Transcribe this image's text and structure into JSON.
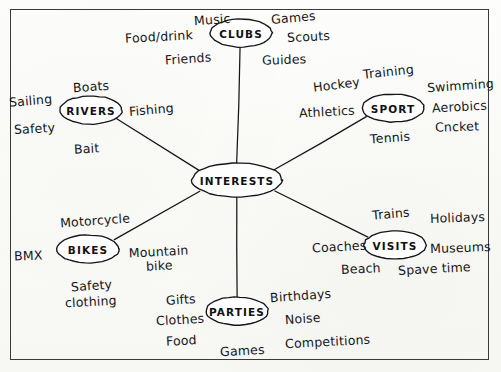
{
  "diagram": {
    "style": {
      "ink": "#15151a",
      "paper": "#fbfbf9",
      "frame": "#3a3a38"
    },
    "center": {
      "label": "INTERESTS",
      "cx": 237,
      "cy": 180,
      "rx": 45,
      "ry": 17
    },
    "branches": [
      {
        "id": "clubs",
        "label": "CLUBS",
        "cx": 241,
        "cy": 33,
        "rx": 31,
        "ry": 14,
        "leaves": [
          {
            "text": "Music",
            "x": 194,
            "y": 13,
            "rot": -4
          },
          {
            "text": "Games",
            "x": 271,
            "y": 11,
            "rot": -5
          },
          {
            "text": "Food/drink",
            "x": 125,
            "y": 30,
            "rot": -3
          },
          {
            "text": "Scouts",
            "x": 287,
            "y": 30,
            "rot": -3
          },
          {
            "text": "Friends",
            "x": 165,
            "y": 52,
            "rot": -4
          },
          {
            "text": "Guides",
            "x": 262,
            "y": 53,
            "rot": -2
          }
        ]
      },
      {
        "id": "sport",
        "label": "SPORT",
        "cx": 393,
        "cy": 108,
        "rx": 31,
        "ry": 14,
        "leaves": [
          {
            "text": "Hockey",
            "x": 313,
            "y": 78,
            "rot": -7
          },
          {
            "text": "Training",
            "x": 363,
            "y": 65,
            "rot": -6
          },
          {
            "text": "Swimming",
            "x": 427,
            "y": 79,
            "rot": -4
          },
          {
            "text": "Athletics",
            "x": 299,
            "y": 105,
            "rot": -3
          },
          {
            "text": "Aerobics",
            "x": 432,
            "y": 100,
            "rot": -3
          },
          {
            "text": "Cncket",
            "x": 435,
            "y": 120,
            "rot": -2
          },
          {
            "text": "Tennis",
            "x": 370,
            "y": 131,
            "rot": -4
          }
        ]
      },
      {
        "id": "visits",
        "label": "VISITS",
        "cx": 395,
        "cy": 245,
        "rx": 31,
        "ry": 14,
        "leaves": [
          {
            "text": "Trains",
            "x": 372,
            "y": 207,
            "rot": -5
          },
          {
            "text": "Holidays",
            "x": 430,
            "y": 211,
            "rot": -2
          },
          {
            "text": "Coaches",
            "x": 312,
            "y": 240,
            "rot": -3
          },
          {
            "text": "Museums",
            "x": 430,
            "y": 241,
            "rot": -2
          },
          {
            "text": "Beach",
            "x": 341,
            "y": 262,
            "rot": -3
          },
          {
            "text": "Spave time",
            "x": 398,
            "y": 262,
            "rot": -3
          }
        ]
      },
      {
        "id": "parties",
        "label": "PARTIES",
        "cx": 237,
        "cy": 311,
        "rx": 31,
        "ry": 14,
        "leaves": [
          {
            "text": "Gifts",
            "x": 166,
            "y": 293,
            "rot": -4
          },
          {
            "text": "Birthdays",
            "x": 270,
            "y": 289,
            "rot": -4
          },
          {
            "text": "Clothes",
            "x": 156,
            "y": 313,
            "rot": -3
          },
          {
            "text": "Noise",
            "x": 285,
            "y": 312,
            "rot": -4
          },
          {
            "text": "Food",
            "x": 166,
            "y": 334,
            "rot": -3
          },
          {
            "text": "Games",
            "x": 220,
            "y": 344,
            "rot": -3
          },
          {
            "text": "Competitions",
            "x": 285,
            "y": 335,
            "rot": -3
          }
        ]
      },
      {
        "id": "bikes",
        "label": "BIKES",
        "cx": 88,
        "cy": 249,
        "rx": 31,
        "ry": 14,
        "leaves": [
          {
            "text": "Motorcycle",
            "x": 60,
            "y": 214,
            "rot": -4
          },
          {
            "text": "BMX",
            "x": 14,
            "y": 249,
            "rot": -2
          },
          {
            "text": "Mountain bike",
            "x": 128,
            "y": 245,
            "rot": -3,
            "two_line": true,
            "width": 62
          },
          {
            "text": "Safety",
            "x": 71,
            "y": 279,
            "rot": -4
          },
          {
            "text": "clothing",
            "x": 65,
            "y": 295,
            "rot": -3
          }
        ]
      },
      {
        "id": "rivers",
        "label": "RIVERS",
        "cx": 91,
        "cy": 110,
        "rx": 31,
        "ry": 14,
        "leaves": [
          {
            "text": "Boats",
            "x": 73,
            "y": 80,
            "rot": -4
          },
          {
            "text": "Sailing",
            "x": 9,
            "y": 94,
            "rot": -5
          },
          {
            "text": "Fishing",
            "x": 129,
            "y": 103,
            "rot": -5
          },
          {
            "text": "Safety",
            "x": 14,
            "y": 122,
            "rot": -3
          },
          {
            "text": "Bait",
            "x": 74,
            "y": 142,
            "rot": -3
          }
        ]
      }
    ],
    "connectors": [
      {
        "from": "interests",
        "to": "clubs",
        "x1": 237,
        "y1": 163,
        "x2": 240,
        "y2": 47
      },
      {
        "from": "interests",
        "to": "sport",
        "x1": 274,
        "y1": 170,
        "x2": 366,
        "y2": 117
      },
      {
        "from": "interests",
        "to": "visits",
        "x1": 275,
        "y1": 191,
        "x2": 368,
        "y2": 237
      },
      {
        "from": "interests",
        "to": "parties",
        "x1": 237,
        "y1": 197,
        "x2": 237,
        "y2": 297
      },
      {
        "from": "interests",
        "to": "bikes",
        "x1": 200,
        "y1": 191,
        "x2": 114,
        "y2": 240
      },
      {
        "from": "interests",
        "to": "rivers",
        "x1": 199,
        "y1": 170,
        "x2": 117,
        "y2": 119
      }
    ]
  }
}
